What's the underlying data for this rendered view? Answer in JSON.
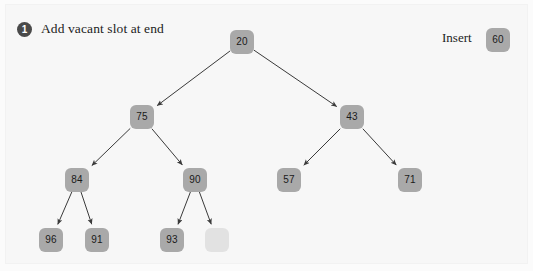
{
  "figure": {
    "background_color": "#f7f7f7",
    "node_color": "#a9a9a9",
    "vacant_color": "#e2e2e2",
    "edge_color": "#3a3a3a"
  },
  "step": {
    "number": "1",
    "caption": "Add vacant slot at end"
  },
  "insert": {
    "label": "Insert",
    "value": "60",
    "x": 486,
    "y": 28
  },
  "chart_data": {
    "type": "diagram",
    "title": "Add vacant slot at end",
    "nodes": [
      {
        "id": "n20",
        "label": "20",
        "x": 230,
        "y": 30,
        "vacant": false
      },
      {
        "id": "n75",
        "label": "75",
        "x": 130,
        "y": 105,
        "vacant": false
      },
      {
        "id": "n43",
        "label": "43",
        "x": 340,
        "y": 105,
        "vacant": false
      },
      {
        "id": "n84",
        "label": "84",
        "x": 65,
        "y": 168,
        "vacant": false
      },
      {
        "id": "n90",
        "label": "90",
        "x": 183,
        "y": 168,
        "vacant": false
      },
      {
        "id": "n57",
        "label": "57",
        "x": 277,
        "y": 168,
        "vacant": false
      },
      {
        "id": "n71",
        "label": "71",
        "x": 398,
        "y": 168,
        "vacant": false
      },
      {
        "id": "n96",
        "label": "96",
        "x": 39,
        "y": 228,
        "vacant": false
      },
      {
        "id": "n91",
        "label": "91",
        "x": 85,
        "y": 228,
        "vacant": false
      },
      {
        "id": "n93",
        "label": "93",
        "x": 160,
        "y": 228,
        "vacant": false
      },
      {
        "id": "nvac",
        "label": "",
        "x": 205,
        "y": 228,
        "vacant": true
      }
    ],
    "edges": [
      {
        "from": "n20",
        "to": "n75"
      },
      {
        "from": "n20",
        "to": "n43"
      },
      {
        "from": "n75",
        "to": "n84"
      },
      {
        "from": "n75",
        "to": "n90"
      },
      {
        "from": "n43",
        "to": "n57"
      },
      {
        "from": "n43",
        "to": "n71"
      },
      {
        "from": "n84",
        "to": "n96"
      },
      {
        "from": "n84",
        "to": "n91"
      },
      {
        "from": "n90",
        "to": "n93"
      },
      {
        "from": "n90",
        "to": "nvac"
      }
    ]
  }
}
